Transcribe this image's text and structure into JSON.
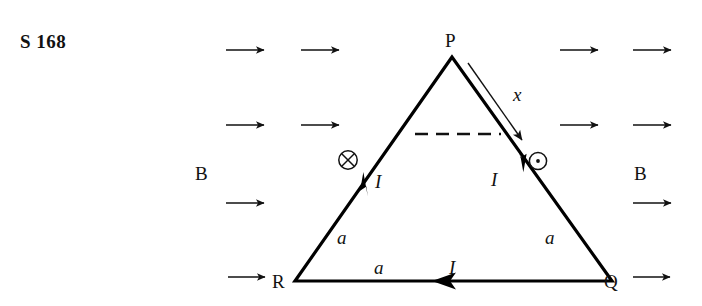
{
  "figure": {
    "question_label": "S 168",
    "vertices": {
      "apex": "P",
      "bottom_left": "R",
      "bottom_right": "Q"
    },
    "side_labels": {
      "left": "a",
      "right": "a",
      "bottom": "a"
    },
    "current_labels": {
      "left": "I",
      "right": "I",
      "bottom": "I"
    },
    "distance_label": "x",
    "field_label_left": "B",
    "field_label_right": "B",
    "field_symbols": {
      "into_page": "into-page-cross-symbol",
      "out_of_page": "out-of-page-dot-symbol"
    },
    "icons": {
      "field-arrow": "right-arrow-icon",
      "current-arrow": "current-direction-arrow-icon",
      "x-arrow": "distance-arrow-icon",
      "dashed-line": "dashed-construction-line"
    },
    "colors": {
      "ink": "#111111",
      "stroke": "#000000"
    }
  }
}
